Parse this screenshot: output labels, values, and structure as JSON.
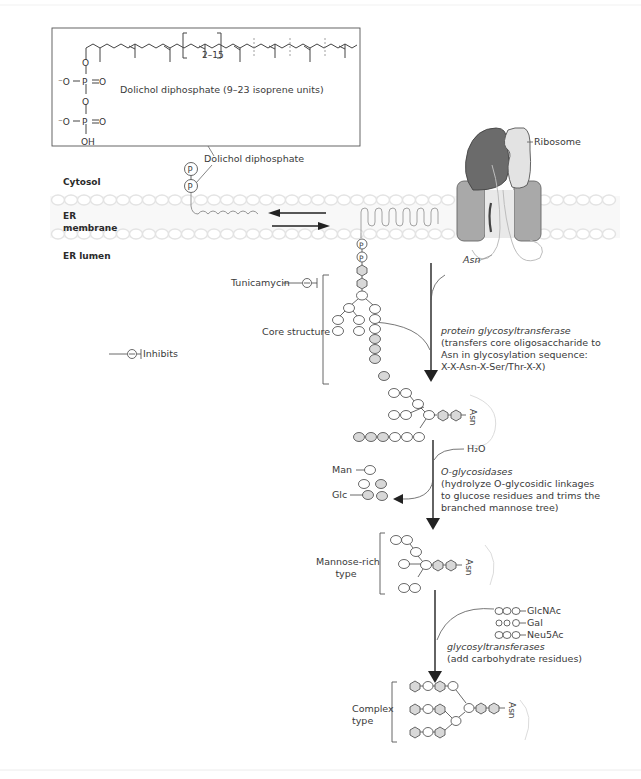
{
  "dolichol_box": {
    "title": "Dolichol diphosphate (9–23 isoprene units)",
    "repeat_label": "2–15",
    "phosphate_atoms": {
      "oxygen": "O",
      "phosphorus": "P",
      "double_o": "O",
      "anion_o": "⁻O",
      "hydroxyl": "OH"
    }
  },
  "labels": {
    "dolichol_diphosphate": "Dolichol diphosphate",
    "phosphate_symbol": "P",
    "cytosol": "Cytosol",
    "er_membrane_line1": "ER",
    "er_membrane_line2": "membrane",
    "er_lumen": "ER lumen",
    "ribosome": "Ribosome",
    "asn": "Asn",
    "tunicamycin": "Tunicamycin",
    "core_structure": "Core structure",
    "inhibits": "Inhibits",
    "mannose_rich_line1": "Mannose-rich",
    "mannose_rich_line2": "type",
    "complex_line1": "Complex",
    "complex_line2": "type",
    "man": "Man",
    "glc": "Glc",
    "h2o": "H₂O",
    "glcnac": "GlcNAc",
    "gal": "Gal",
    "neu5ac": "Neu5Ac"
  },
  "steps": [
    {
      "enzyme": "protein glycosyltransferase",
      "description": [
        "(transfers core oligosaccharide to",
        "Asn in glycosylation sequence:",
        "X-X-Asn-X-Ser/Thr-X-X)"
      ]
    },
    {
      "enzyme": "O-glycosidases",
      "description": [
        "(hydrolyze O-glycosidic linkages",
        "to glucose residues and trims the",
        "branched mannose tree)"
      ]
    },
    {
      "enzyme": "glycosyltransferases",
      "description": [
        "(add carbohydrate residues)"
      ]
    }
  ],
  "colors": {
    "line": "#3a3a3a",
    "hexagon_fill": "#d9d9d9",
    "glc_fill": "#dcdcdc",
    "membrane": "#e8e8e8",
    "ribosome_large": "#6e6e6e",
    "ribosome_small": "#e2e2e2",
    "translocon": "#a8a8a8",
    "peptide": "#d0d0d0"
  }
}
